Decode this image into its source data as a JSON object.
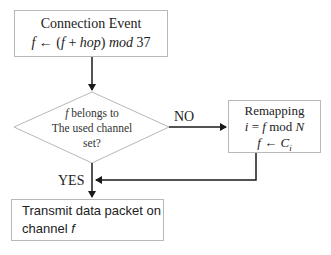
{
  "diagram": {
    "type": "flowchart",
    "nodes": {
      "connection_event": {
        "title": "Connection Event",
        "formula_parts": [
          "f",
          " ← (",
          "f",
          " + ",
          "hop",
          ") ",
          "mod",
          " 37"
        ]
      },
      "decision": {
        "line1_var": "f",
        "line1_text": " belongs to",
        "line2": "The used channel",
        "line3": "set?"
      },
      "remapping": {
        "title": "Remapping",
        "line2_parts": [
          "i",
          " = ",
          "f",
          " mod ",
          "N"
        ],
        "line3_parts": [
          "f",
          " ← ",
          "C",
          "i"
        ]
      },
      "transmit": {
        "line1": "Transmit data packet on",
        "line2_text": "channel ",
        "line2_var": "f"
      }
    },
    "edges": {
      "no_label": "NO",
      "yes_label": "YES"
    },
    "colors": {
      "box_border": "#b8b8b8",
      "arrow": "#1a1a1a",
      "text": "#222222"
    }
  }
}
